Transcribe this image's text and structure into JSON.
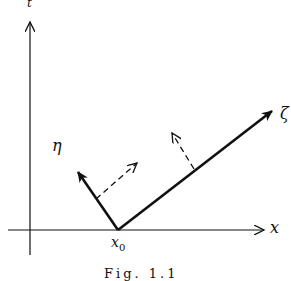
{
  "diagram": {
    "labels": {
      "vertical_axis": "t",
      "horizontal_axis": "x",
      "eta": "η",
      "zeta": "ζ",
      "origin": "x",
      "origin_sub": "0",
      "caption": "Fig. 1.1"
    },
    "colors": {
      "ink": "#111111",
      "background": "#ffffff"
    }
  }
}
